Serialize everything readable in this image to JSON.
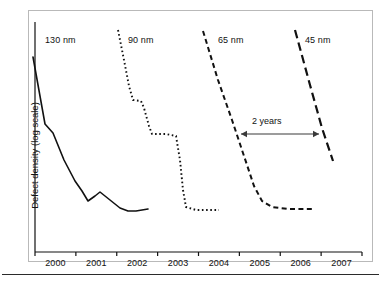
{
  "figure": {
    "y_axis_title": "Defect density (log scale)",
    "annotation": {
      "label": "2 years",
      "type": "double-headed-arrow",
      "x_from": 2004.45,
      "x_to": 2006.3
    }
  },
  "chart_data": {
    "type": "line",
    "title": "",
    "xlabel": "",
    "ylabel": "Defect density (log scale)",
    "xlim": [
      1999.5,
      2007.5
    ],
    "x_ticks": [
      2000,
      2001,
      2002,
      2003,
      2004,
      2005,
      2006,
      2007
    ],
    "x_tick_labels": [
      "2000",
      "2001",
      "2002",
      "2003",
      "2004",
      "2005",
      "2006",
      "2007"
    ],
    "y_scale": "log",
    "y_ticks": [],
    "y_tick_labels": [],
    "grid": false,
    "legend": "inline-series-labels",
    "series": [
      {
        "name": "130 nm",
        "label": "130 nm",
        "line_style": "solid",
        "label_x": 45,
        "label_y": 35,
        "points": [
          [
            33,
            57
          ],
          [
            45,
            124
          ],
          [
            53,
            133
          ],
          [
            64,
            160
          ],
          [
            75,
            181
          ],
          [
            82,
            191
          ],
          [
            88,
            201
          ],
          [
            95,
            196
          ],
          [
            100,
            192
          ],
          [
            110,
            200
          ],
          [
            120,
            208
          ],
          [
            128,
            211
          ],
          [
            136,
            211
          ],
          [
            148,
            209
          ]
        ]
      },
      {
        "name": "90 nm",
        "label": "90 nm",
        "line_style": "dotted",
        "label_x": 128,
        "label_y": 35,
        "points": [
          [
            118,
            30
          ],
          [
            124,
            60
          ],
          [
            129,
            86
          ],
          [
            133,
            100
          ],
          [
            141,
            101
          ],
          [
            144,
            108
          ],
          [
            149,
            126
          ],
          [
            152,
            134
          ],
          [
            166,
            134
          ],
          [
            176,
            136
          ],
          [
            180,
            160
          ],
          [
            183,
            190
          ],
          [
            186,
            207
          ],
          [
            196,
            210
          ],
          [
            210,
            210
          ],
          [
            219,
            210
          ]
        ]
      },
      {
        "name": "65 nm",
        "label": "65 nm",
        "line_style": "dashed",
        "label_x": 218,
        "label_y": 35,
        "points": [
          [
            203,
            31
          ],
          [
            218,
            80
          ],
          [
            232,
            120
          ],
          [
            242,
            150
          ],
          [
            247,
            165
          ],
          [
            254,
            186
          ],
          [
            262,
            201
          ],
          [
            272,
            207
          ],
          [
            288,
            209
          ],
          [
            305,
            209
          ],
          [
            312,
            209
          ]
        ]
      },
      {
        "name": "45 nm",
        "label": "45 nm",
        "line_style": "long-dashed",
        "label_x": 305,
        "label_y": 35,
        "points": [
          [
            295,
            30
          ],
          [
            310,
            85
          ],
          [
            322,
            128
          ],
          [
            333,
            161
          ]
        ]
      }
    ]
  }
}
